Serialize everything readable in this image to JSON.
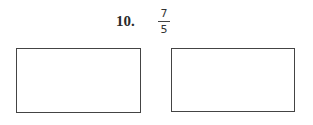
{
  "problem": {
    "number_label": "10.",
    "fraction": {
      "numerator": "7",
      "denominator": "5"
    }
  },
  "answer_boxes": [
    {
      "id": "left",
      "value": ""
    },
    {
      "id": "right",
      "value": ""
    }
  ]
}
